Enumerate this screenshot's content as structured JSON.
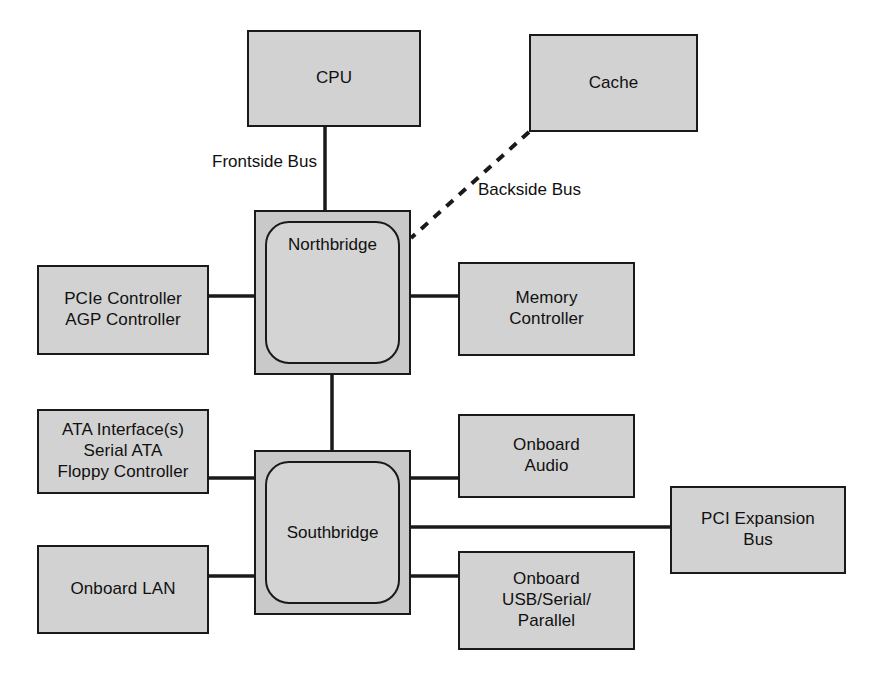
{
  "diagram": {
    "background_color": "#ffffff",
    "box_fill_color": "#d2d2d2",
    "bridge_fill_color": "#c9c9c9",
    "line_color": "#1a1a1a"
  },
  "nodes": {
    "cpu": {
      "label": "CPU",
      "x": 247,
      "y": 30,
      "w": 174,
      "h": 97
    },
    "cache": {
      "label": "Cache",
      "x": 529,
      "y": 34,
      "w": 169,
      "h": 98
    },
    "northbridge": {
      "label": "Northbridge",
      "x": 254,
      "y": 210,
      "w": 157,
      "h": 165
    },
    "southbridge": {
      "label": "Southbridge",
      "x": 254,
      "y": 450,
      "w": 157,
      "h": 165
    },
    "pcie_agp": {
      "label": "PCIe Controller\nAGP Controller",
      "x": 37,
      "y": 265,
      "w": 172,
      "h": 90
    },
    "memory_controller": {
      "label": "Memory\nController",
      "x": 458,
      "y": 262,
      "w": 177,
      "h": 94
    },
    "ata": {
      "label": "ATA Interface(s)\nSerial ATA\nFloppy Controller",
      "x": 37,
      "y": 409,
      "w": 172,
      "h": 85
    },
    "onboard_lan": {
      "label": "Onboard LAN",
      "x": 37,
      "y": 545,
      "w": 172,
      "h": 89
    },
    "onboard_audio": {
      "label": "Onboard\nAudio",
      "x": 458,
      "y": 414,
      "w": 177,
      "h": 84
    },
    "onboard_usb": {
      "label": "Onboard\nUSB/Serial/\nParallel",
      "x": 458,
      "y": 551,
      "w": 177,
      "h": 99
    },
    "pci_expansion": {
      "label": "PCI Expansion\nBus",
      "x": 670,
      "y": 486,
      "w": 176,
      "h": 88
    }
  },
  "bus_labels": {
    "frontside": {
      "text": "Frontside Bus",
      "x": 212,
      "y": 152
    },
    "backside": {
      "text": "Backside Bus",
      "x": 478,
      "y": 180
    }
  },
  "connections": [
    {
      "name": "cpu-to-northbridge",
      "label": "Frontside Bus",
      "style": "solid",
      "x1": 325,
      "y1": 127,
      "x2": 325,
      "y2": 210
    },
    {
      "name": "cache-to-northbridge",
      "label": "Backside Bus",
      "style": "dashed",
      "x1": 529,
      "y1": 132,
      "x2": 411,
      "y2": 238
    },
    {
      "name": "pcie-agp-to-northbridge",
      "label": "",
      "style": "solid",
      "x1": 209,
      "y1": 296,
      "x2": 254,
      "y2": 296
    },
    {
      "name": "northbridge-to-memory-controller",
      "label": "",
      "style": "solid",
      "x1": 411,
      "y1": 296,
      "x2": 458,
      "y2": 296
    },
    {
      "name": "northbridge-to-southbridge",
      "label": "",
      "style": "solid",
      "x1": 332,
      "y1": 375,
      "x2": 332,
      "y2": 450
    },
    {
      "name": "ata-to-southbridge",
      "label": "",
      "style": "solid",
      "x1": 209,
      "y1": 478,
      "x2": 254,
      "y2": 478
    },
    {
      "name": "onboard-lan-to-southbridge",
      "label": "",
      "style": "solid",
      "x1": 209,
      "y1": 576,
      "x2": 254,
      "y2": 576
    },
    {
      "name": "southbridge-to-onboard-audio",
      "label": "",
      "style": "solid",
      "x1": 411,
      "y1": 478,
      "x2": 458,
      "y2": 478
    },
    {
      "name": "southbridge-to-pci-expansion",
      "label": "",
      "style": "solid",
      "x1": 411,
      "y1": 527,
      "x2": 670,
      "y2": 527
    },
    {
      "name": "southbridge-to-onboard-usb",
      "label": "",
      "style": "solid",
      "x1": 411,
      "y1": 576,
      "x2": 458,
      "y2": 576
    }
  ]
}
